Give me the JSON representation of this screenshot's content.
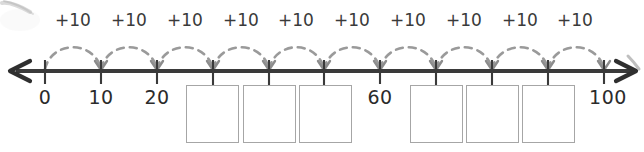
{
  "worksheet": {
    "type": "number-line-skip-counting",
    "colors": {
      "line": "#3a3a3a",
      "tick": "#3a3a3a",
      "arc": "#9a9a9a",
      "arrowhead": "#8c8c8c",
      "box_border": "#a6a6a6",
      "label_text": "#2b2b2b",
      "background": "#ffffff"
    },
    "number_line": {
      "start_label": "0",
      "end_label": "100",
      "left_arrow": "left-arrowhead",
      "right_arrow": "right-arrowhead",
      "tick_count": 11,
      "tick_values": [
        0,
        10,
        20,
        30,
        40,
        50,
        60,
        70,
        80,
        90,
        100
      ],
      "visible_labels": [
        {
          "value": 0,
          "text": "0",
          "x": 45
        },
        {
          "value": 10,
          "text": "10",
          "x": 101
        },
        {
          "value": 20,
          "text": "20",
          "x": 157
        },
        {
          "value": 60,
          "text": "60",
          "x": 380
        },
        {
          "value": 100,
          "text": "100",
          "x": 608
        }
      ],
      "blank_values": [
        30,
        40,
        50,
        70,
        80,
        90
      ]
    },
    "jumps": {
      "label": "+10",
      "count": 10,
      "labels": [
        "+10",
        "+10",
        "+10",
        "+10",
        "+10",
        "+10",
        "+10",
        "+10",
        "+10",
        "+10"
      ],
      "centers_x": [
        73,
        129,
        185,
        241,
        296,
        352,
        408,
        464,
        520,
        575
      ]
    },
    "answer_boxes": {
      "count": 6,
      "values": [
        "",
        "",
        "",
        "",
        "",
        ""
      ],
      "positions": [
        {
          "x": 186,
          "y": 85,
          "w": 53,
          "h": 58
        },
        {
          "x": 243,
          "y": 85,
          "w": 53,
          "h": 58
        },
        {
          "x": 299,
          "y": 85,
          "w": 53,
          "h": 58
        },
        {
          "x": 410,
          "y": 85,
          "w": 53,
          "h": 58
        },
        {
          "x": 466,
          "y": 85,
          "w": 53,
          "h": 58
        },
        {
          "x": 522,
          "y": 85,
          "w": 53,
          "h": 58
        }
      ]
    }
  }
}
